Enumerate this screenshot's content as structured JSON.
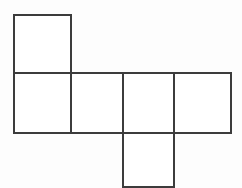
{
  "figure": {
    "canvas": {
      "width": 242,
      "height": 188
    },
    "style": {
      "background_color": "#fdfdfd",
      "line_color": "#3c3c3c",
      "line_width": 2,
      "fill_color": "#ffffff"
    },
    "grid": {
      "cell_size": 57,
      "x_positions": [
        14,
        71,
        123,
        174,
        231
      ],
      "y_positions": [
        15,
        73,
        133,
        190
      ]
    },
    "squares": [
      {
        "name": "top-square",
        "x": 14,
        "y": 15,
        "width": 57,
        "height": 58
      },
      {
        "name": "middle-square-1",
        "x": 14,
        "y": 73,
        "width": 57,
        "height": 60
      },
      {
        "name": "middle-square-2",
        "x": 71,
        "y": 73,
        "width": 52,
        "height": 60
      },
      {
        "name": "middle-square-3",
        "x": 123,
        "y": 73,
        "width": 51,
        "height": 60
      },
      {
        "name": "middle-square-4",
        "x": 174,
        "y": 73,
        "width": 57,
        "height": 60
      },
      {
        "name": "bottom-square",
        "x": 123,
        "y": 133,
        "width": 51,
        "height": 57
      }
    ],
    "segments": [
      {
        "name": "top-square-top-edge",
        "x1": 14,
        "y1": 15,
        "x2": 71,
        "y2": 15
      },
      {
        "name": "top-square-left-edge",
        "x1": 14,
        "y1": 15,
        "x2": 14,
        "y2": 73
      },
      {
        "name": "vertical-divider-x71",
        "x1": 71,
        "y1": 15,
        "x2": 71,
        "y2": 133
      },
      {
        "name": "middle-row-top-edge",
        "x1": 14,
        "y1": 73,
        "x2": 231,
        "y2": 73
      },
      {
        "name": "middle-row-left-edge",
        "x1": 14,
        "y1": 73,
        "x2": 14,
        "y2": 133
      },
      {
        "name": "middle-row-bottom-edge",
        "x1": 14,
        "y1": 133,
        "x2": 231,
        "y2": 133
      },
      {
        "name": "middle-row-right-edge",
        "x1": 231,
        "y1": 73,
        "x2": 231,
        "y2": 133
      },
      {
        "name": "vertical-divider-x123",
        "x1": 123,
        "y1": 73,
        "x2": 123,
        "y2": 190
      },
      {
        "name": "vertical-divider-x174",
        "x1": 174,
        "y1": 73,
        "x2": 174,
        "y2": 190
      },
      {
        "name": "bottom-square-bottom-edge",
        "x1": 123,
        "y1": 187,
        "x2": 174,
        "y2": 187
      }
    ]
  }
}
